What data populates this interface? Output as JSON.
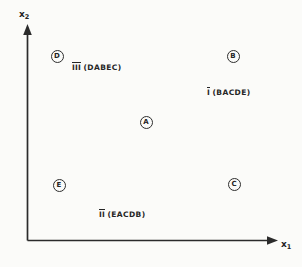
{
  "figure": {
    "background_color": "#fbfbf9",
    "ink_color": "#2b2b2b"
  },
  "axes": {
    "x_label_base": "x",
    "x_label_sub": "1",
    "y_label_base": "x",
    "y_label_sub": "2"
  },
  "points": [
    {
      "id": "D",
      "label": "D",
      "x": 57,
      "y": 56
    },
    {
      "id": "B",
      "label": "B",
      "x": 233,
      "y": 56
    },
    {
      "id": "A",
      "label": "A",
      "x": 146,
      "y": 122
    },
    {
      "id": "E",
      "label": "E",
      "x": 59,
      "y": 185
    },
    {
      "id": "C",
      "label": "C",
      "x": 234,
      "y": 184
    }
  ],
  "group_labels": [
    {
      "id": "III",
      "roman": "III",
      "ordering": "(DABEC)",
      "x": 72,
      "y": 64
    },
    {
      "id": "I",
      "roman": "I",
      "ordering": "(BACDE)",
      "x": 207,
      "y": 89
    },
    {
      "id": "II",
      "roman": "II",
      "ordering": "(EACDB)",
      "x": 99,
      "y": 211
    }
  ],
  "chart_data": {
    "type": "scatter",
    "title": "",
    "xlabel": "x1",
    "ylabel": "x2",
    "grid": false,
    "legend": "none",
    "axis_style": "arrow-terminated L-shaped axes, no tick marks, no numeric scale",
    "xlim": [
      0,
      1
    ],
    "ylim": [
      0,
      1
    ],
    "points": [
      {
        "name": "D",
        "x": 0.12,
        "y": 0.84
      },
      {
        "name": "B",
        "x": 0.83,
        "y": 0.84
      },
      {
        "name": "A",
        "x": 0.48,
        "y": 0.55
      },
      {
        "name": "E",
        "x": 0.13,
        "y": 0.26
      },
      {
        "name": "C",
        "x": 0.83,
        "y": 0.26
      }
    ],
    "annotations": [
      {
        "text": "III (DABEC)",
        "x": 0.21,
        "y": 0.8
      },
      {
        "text": "I (BACDE)",
        "x": 0.84,
        "y": 0.69
      },
      {
        "text": "II (EACDB)",
        "x": 0.37,
        "y": 0.15
      }
    ]
  }
}
